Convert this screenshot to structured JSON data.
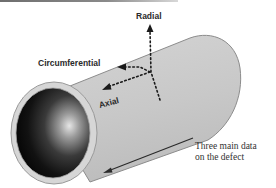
{
  "figure": {
    "labels": {
      "radial": "Radial",
      "circumferential": "Circumferential",
      "axial": "Axial"
    },
    "caption": {
      "line1": "Three main data",
      "line2": "on the defect"
    },
    "colors": {
      "pipe_body": "#c9c9c9",
      "pipe_outline": "#8c8c8c",
      "pipe_interior_dark": "#0c0c0c",
      "pipe_interior_highlight": "#dcdcdc",
      "arrow": "#1a1a1a",
      "text": "#2a2a2a"
    }
  }
}
